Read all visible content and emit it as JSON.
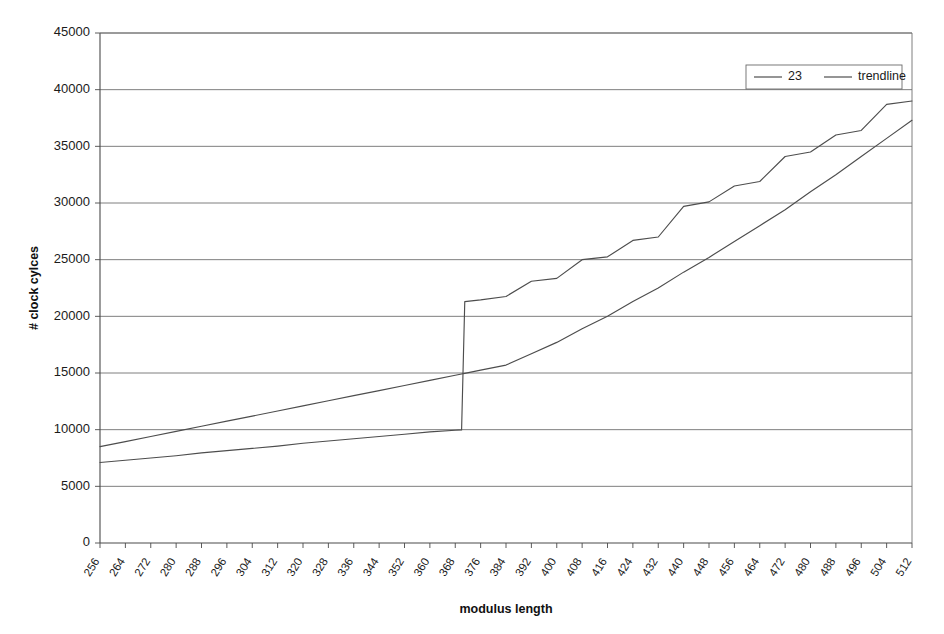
{
  "chart_data": {
    "type": "line",
    "title": "",
    "xlabel": "modulus length",
    "ylabel": "# clock cylces",
    "xlim": [
      256,
      512
    ],
    "ylim": [
      0,
      45000
    ],
    "grid": true,
    "legend_position": "top-right",
    "x_tick_labels": [
      "256",
      "264",
      "272",
      "280",
      "288",
      "296",
      "304",
      "312",
      "320",
      "328",
      "336",
      "344",
      "352",
      "360",
      "368",
      "376",
      "384",
      "392",
      "400",
      "408",
      "416",
      "424",
      "432",
      "440",
      "448",
      "456",
      "464",
      "472",
      "480",
      "488",
      "496",
      "504",
      "512"
    ],
    "y_tick_labels": [
      "0",
      "5000",
      "10000",
      "15000",
      "20000",
      "25000",
      "30000",
      "35000",
      "40000",
      "45000"
    ],
    "y_tick_values": [
      0,
      5000,
      10000,
      15000,
      20000,
      25000,
      30000,
      35000,
      40000,
      45000
    ],
    "x": [
      256,
      264,
      272,
      280,
      288,
      296,
      304,
      312,
      320,
      328,
      336,
      344,
      352,
      360,
      368,
      370,
      371,
      376,
      384,
      392,
      400,
      408,
      416,
      424,
      432,
      440,
      448,
      456,
      464,
      472,
      480,
      488,
      496,
      504,
      512
    ],
    "series": [
      {
        "name": "23",
        "values": [
          7100,
          7300,
          7500,
          7700,
          7950,
          8150,
          8350,
          8550,
          8800,
          9000,
          9200,
          9400,
          9600,
          9800,
          9950,
          9980,
          21300,
          21450,
          21750,
          23100,
          23350,
          25000,
          25250,
          26700,
          27000,
          29700,
          30100,
          31500,
          31900,
          34100,
          34500,
          36000,
          36400,
          38700,
          39000
        ]
      },
      {
        "name": "trendline",
        "values": [
          8500,
          8950,
          9400,
          9850,
          10300,
          10750,
          11200,
          11650,
          12100,
          12550,
          13000,
          13450,
          13900,
          14350,
          14800,
          14910,
          14970,
          15250,
          15700,
          16700,
          17700,
          18900,
          20000,
          21300,
          22500,
          23900,
          25200,
          26600,
          28000,
          29400,
          31000,
          32500,
          34100,
          35700,
          37300
        ]
      }
    ],
    "legend": [
      {
        "label": "23"
      },
      {
        "label": "trendline"
      }
    ]
  },
  "axes": {
    "x_title": "modulus length",
    "y_title": "# clock cylces"
  }
}
